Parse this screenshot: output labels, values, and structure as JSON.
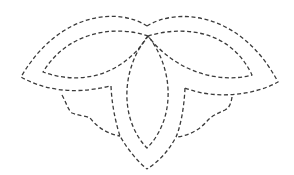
{
  "figure": {
    "title": "",
    "stroke_color": "#3a3a3a",
    "background": "#ffffff"
  },
  "shapes": [
    {
      "name": "outer-left-petal",
      "d": "M147,26 C120,8 60,10 21,77 C40,88 70,96 110,86"
    },
    {
      "name": "inner-left-petal",
      "d": "M148,36 C120,26 70,28 43,72 C75,84 120,80 148,36"
    },
    {
      "name": "outer-right-petal",
      "d": "M147,26 C175,8 240,10 278,82 C255,95 215,100 185,88"
    },
    {
      "name": "inner-right-petal",
      "d": "M148,36 C180,26 230,28 252,75 C220,84 175,72 148,36"
    },
    {
      "name": "center-inner-petal",
      "d": "M148,36 C120,70 120,120 147,148 C175,120 175,70 148,36"
    },
    {
      "name": "center-outer-left-stem",
      "d": "M111,86 C112,110 118,130 120,136 C128,150 138,162 147,169"
    },
    {
      "name": "center-outer-right-stem",
      "d": "M185,88 C184,110 180,128 176,137 C168,152 158,162 147,169"
    },
    {
      "name": "left-lower-leaf",
      "d": "M62,95 C66,102 68,110 72,113 C80,116 86,116 90,118 C98,128 108,134 120,136"
    },
    {
      "name": "right-lower-leaf",
      "d": "M232,97 C231,104 229,108 225,110 C216,114 212,116 208,120 C200,130 188,136 176,137"
    }
  ]
}
